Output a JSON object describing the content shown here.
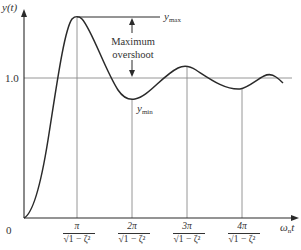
{
  "diagram": {
    "y_axis_label": "y(t)",
    "x_axis_label": "ωnt",
    "x_axis_label_base": "ω",
    "x_axis_label_sub": "n",
    "x_axis_label_suffix": "t",
    "origin_label": "0",
    "y_ref_label": "1.0",
    "ymax_label_base": "y",
    "ymax_label_sub": "max",
    "ymin_label_base": "y",
    "ymin_label_sub": "min",
    "annotation_line1": "Maximum",
    "annotation_line2": "overshoot",
    "x_ticks": [
      {
        "num": "π",
        "den": "√1 − ζ²"
      },
      {
        "num": "2π",
        "den": "√1 − ζ²"
      },
      {
        "num": "3π",
        "den": "√1 − ζ²"
      },
      {
        "num": "4π",
        "den": "√1 − ζ²"
      }
    ],
    "colors": {
      "curve": "#2a2a2a",
      "axes": "#2a2a2a",
      "gridlines": "#8a8a8a"
    }
  }
}
